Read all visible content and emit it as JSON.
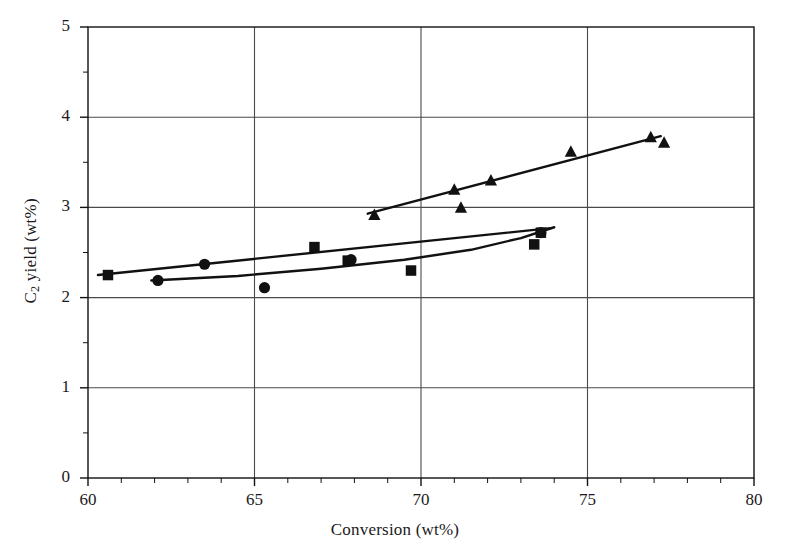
{
  "chart_data": {
    "type": "scatter",
    "title": "",
    "xlabel": "Conversion (wt%)",
    "ylabel_parts": {
      "pre": "C",
      "sub": "2",
      "post": " yield (wt%)"
    },
    "ylabel": "C2 yield (wt%)",
    "xlim": [
      60,
      80
    ],
    "ylim": [
      0,
      5
    ],
    "x_major_ticks": [
      60,
      65,
      70,
      75,
      80
    ],
    "x_minor_step": 1,
    "y_major_ticks": [
      0,
      1,
      2,
      3,
      4,
      5
    ],
    "y_minor_step": 0.5,
    "x_tick_labels": [
      "60",
      "65",
      "70",
      "75",
      "80"
    ],
    "y_tick_labels": [
      "0",
      "1",
      "2",
      "3",
      "4",
      "5"
    ],
    "grid": "major-both",
    "legend": "none",
    "marker_color": "#111111",
    "line_color": "#111111",
    "axis_color": "#111111",
    "grid_color": "#4a4a4a",
    "series": [
      {
        "name": "Series A (squares)",
        "marker": "square",
        "points": [
          {
            "x": 60.6,
            "y": 2.25
          },
          {
            "x": 66.8,
            "y": 2.56
          },
          {
            "x": 67.8,
            "y": 2.41
          },
          {
            "x": 69.7,
            "y": 2.3
          },
          {
            "x": 73.4,
            "y": 2.59
          },
          {
            "x": 73.6,
            "y": 2.72
          }
        ],
        "trend": {
          "type": "line",
          "x0": 60.3,
          "y0": 2.25,
          "x1": 73.9,
          "y1": 2.77
        }
      },
      {
        "name": "Series B (circles)",
        "marker": "circle",
        "points": [
          {
            "x": 62.1,
            "y": 2.19
          },
          {
            "x": 63.5,
            "y": 2.37
          },
          {
            "x": 65.3,
            "y": 2.11
          },
          {
            "x": 67.9,
            "y": 2.42
          },
          {
            "x": 73.6,
            "y": 2.72
          }
        ],
        "trend": {
          "type": "curve",
          "points": [
            {
              "x": 61.9,
              "y": 2.19
            },
            {
              "x": 64.5,
              "y": 2.24
            },
            {
              "x": 67.0,
              "y": 2.32
            },
            {
              "x": 69.5,
              "y": 2.42
            },
            {
              "x": 71.5,
              "y": 2.53
            },
            {
              "x": 73.0,
              "y": 2.66
            },
            {
              "x": 74.0,
              "y": 2.78
            }
          ]
        }
      },
      {
        "name": "Series C (triangles)",
        "marker": "triangle",
        "points": [
          {
            "x": 68.6,
            "y": 2.91
          },
          {
            "x": 71.0,
            "y": 3.19
          },
          {
            "x": 71.2,
            "y": 2.99
          },
          {
            "x": 72.1,
            "y": 3.29
          },
          {
            "x": 74.5,
            "y": 3.61
          },
          {
            "x": 76.9,
            "y": 3.77
          },
          {
            "x": 77.3,
            "y": 3.71
          }
        ],
        "trend": {
          "type": "line",
          "x0": 68.4,
          "y0": 2.93,
          "x1": 77.2,
          "y1": 3.79
        }
      }
    ]
  }
}
